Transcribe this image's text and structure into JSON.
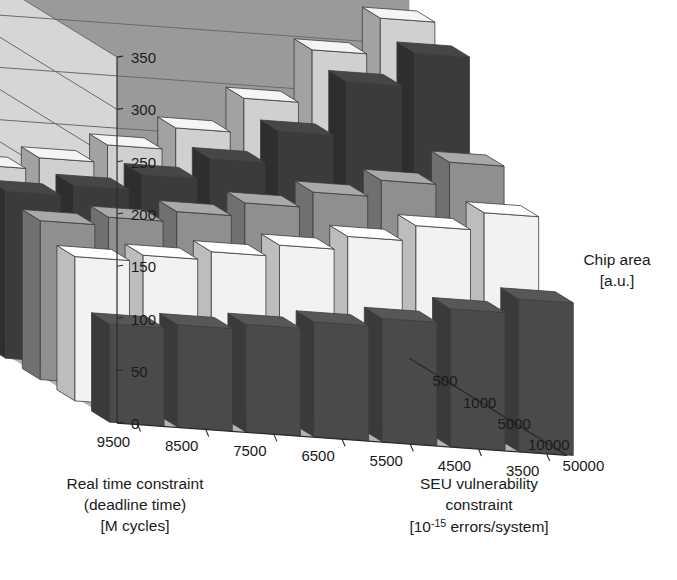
{
  "chart_data": {
    "type": "bar",
    "subtype": "3d-grouped-bar",
    "title": "",
    "xlabel": "Real time constraint (deadline time) [M cycles]",
    "ylabel": "SEU vulnerability constraint [10-15 errors/system]",
    "zlabel": "Chip area [a.u.]",
    "grid": true,
    "legend": "none",
    "x_categories": [
      "3500",
      "4500",
      "5500",
      "6500",
      "7500",
      "8500",
      "9500"
    ],
    "y_categories": [
      "50000",
      "10000",
      "5000",
      "1000",
      "500"
    ],
    "zlim": [
      0,
      350
    ],
    "z_ticks": [
      0,
      50,
      100,
      150,
      200,
      250,
      300,
      350
    ],
    "series": [
      {
        "name": "50000",
        "color": "#4a4a4a",
        "values": [
          146,
          132,
          118,
          110,
          103,
          98,
          94
        ]
      },
      {
        "name": "10000",
        "color": "#f2f2f2",
        "values": [
          208,
          191,
          176,
          163,
          152,
          144,
          138
        ]
      },
      {
        "name": "5000",
        "color": "#8f8f8f",
        "values": [
          236,
          214,
          198,
          183,
          170,
          160,
          152
        ]
      },
      {
        "name": "1000",
        "color": "#3b3b3b",
        "values": [
          320,
          288,
          236,
          205,
          185,
          170,
          160
        ]
      },
      {
        "name": "500",
        "color": "#d0d0d0",
        "values": [
          333,
          298,
          247,
          214,
          193,
          176,
          165
        ]
      }
    ]
  },
  "axes": {
    "x_tick_labels": [
      "3500",
      "4500",
      "5500",
      "6500",
      "7500",
      "8500",
      "9500"
    ],
    "y_tick_labels": [
      "50000",
      "10000",
      "5000",
      "1000",
      "500"
    ],
    "z_tick_labels": [
      "0",
      "50",
      "100",
      "150",
      "200",
      "250",
      "300",
      "350"
    ],
    "x_axis_title_line1": "Real time constraint",
    "x_axis_title_line2": "(deadline time)",
    "x_axis_title_line3": "[M cycles]",
    "y_axis_title_line1": "SEU vulnerability",
    "y_axis_title_line2": "constraint",
    "y_axis_title_line3_pre": "[10",
    "y_axis_title_line3_sup": "-15",
    "y_axis_title_line3_post": " errors/system]",
    "z_axis_title_line1": "Chip area",
    "z_axis_title_line2": "[a.u.]"
  },
  "colors": {
    "back_wall_left": "#9a9a9a",
    "back_wall_right": "#d6d6d6",
    "floor": "#b4b4b4",
    "gridline": "#6a6a6a",
    "text": "#1a1a1a"
  }
}
